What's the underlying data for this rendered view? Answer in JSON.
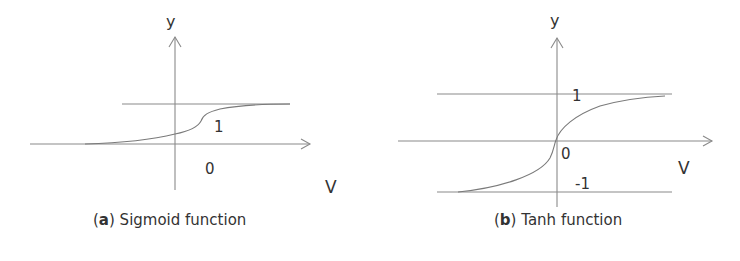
{
  "panels": [
    {
      "id": "a",
      "letter": "a",
      "caption_text": " Sigmoid function",
      "y_label": "y",
      "x_label": "V",
      "level_label": "1",
      "origin_label": "0"
    },
    {
      "id": "b",
      "letter": "b",
      "caption_text": " Tanh function",
      "y_label": "y",
      "x_label": "V",
      "upper_label": "1",
      "lower_label": "-1",
      "origin_label": "0"
    }
  ],
  "colors": {
    "lines": "#8a8a8a",
    "text": "#333333",
    "background": "#ffffff"
  }
}
